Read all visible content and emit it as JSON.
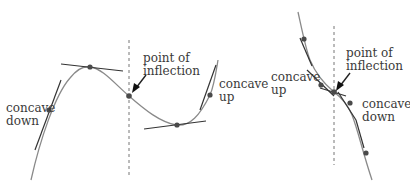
{
  "diagram": {
    "left_panel": {
      "labels": {
        "concave_down_line1": "concave",
        "concave_down_line2": "down",
        "inflection_line1": "point of",
        "inflection_line2": "inflection",
        "concave_up_line1": "concave",
        "concave_up_line2": "up"
      }
    },
    "right_panel": {
      "labels": {
        "concave_up_line1": "concave",
        "concave_up_line2": "up",
        "inflection_line1": "point of",
        "inflection_line2": "inflection",
        "concave_down_line1": "concave",
        "concave_down_line2": "down"
      }
    },
    "colors": {
      "curve": "#8a8a8a",
      "tangent": "#333333",
      "point": "#4a4a4a",
      "text": "#3a3a3a"
    }
  }
}
